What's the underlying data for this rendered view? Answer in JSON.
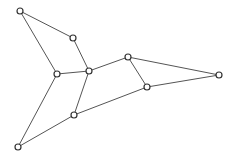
{
  "graph": {
    "canvas": {
      "width": 233,
      "height": 157,
      "background": "#ffffff"
    },
    "style": {
      "edge_color": "#555555",
      "node_stroke": "#333333",
      "node_fill": "#ffffff",
      "node_radius": 3
    },
    "nodes": [
      {
        "id": "A",
        "x": 20,
        "y": 11
      },
      {
        "id": "B",
        "x": 73,
        "y": 38
      },
      {
        "id": "C",
        "x": 57,
        "y": 74
      },
      {
        "id": "D",
        "x": 89,
        "y": 71
      },
      {
        "id": "E",
        "x": 128,
        "y": 57
      },
      {
        "id": "F",
        "x": 147,
        "y": 87
      },
      {
        "id": "G",
        "x": 219,
        "y": 75
      },
      {
        "id": "H",
        "x": 74,
        "y": 115
      },
      {
        "id": "I",
        "x": 18,
        "y": 147
      }
    ],
    "edges": [
      [
        "A",
        "B"
      ],
      [
        "A",
        "C"
      ],
      [
        "B",
        "D"
      ],
      [
        "C",
        "D"
      ],
      [
        "D",
        "E"
      ],
      [
        "E",
        "G"
      ],
      [
        "E",
        "F"
      ],
      [
        "F",
        "G"
      ],
      [
        "F",
        "H"
      ],
      [
        "D",
        "H"
      ],
      [
        "H",
        "I"
      ],
      [
        "C",
        "I"
      ]
    ]
  }
}
